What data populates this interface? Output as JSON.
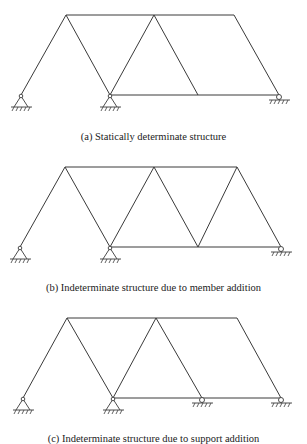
{
  "figures": [
    {
      "id": "a",
      "caption": "(a)  Statically determinate structure",
      "top_y": 15,
      "bottom_y": 95,
      "top_nodes": [
        66,
        154,
        234
      ],
      "bottom_nodes": [
        21,
        110,
        198,
        279
      ],
      "supports": [
        {
          "type": "pin",
          "x": 21
        },
        {
          "type": "pin",
          "x": 110
        },
        {
          "type": "roller",
          "x": 279
        }
      ]
    },
    {
      "id": "b",
      "caption": "(b)  Indeterminate structure due to member addition",
      "top_y": 167,
      "bottom_y": 247,
      "top_nodes": [
        65,
        154,
        237
      ],
      "bottom_nodes": [
        20,
        110,
        198,
        281
      ],
      "supports": [
        {
          "type": "pin",
          "x": 20
        },
        {
          "type": "pin",
          "x": 110
        },
        {
          "type": "roller",
          "x": 281
        }
      ]
    },
    {
      "id": "c",
      "caption": "(c)  Indeterminate structure due to support addition",
      "top_y": 318,
      "bottom_y": 398,
      "top_nodes": [
        67,
        156,
        237
      ],
      "bottom_nodes": [
        23,
        113,
        202,
        281
      ],
      "supports": [
        {
          "type": "pin",
          "x": 23
        },
        {
          "type": "pin",
          "x": 113
        },
        {
          "type": "roller",
          "x": 202
        },
        {
          "type": "roller",
          "x": 281
        }
      ]
    }
  ]
}
